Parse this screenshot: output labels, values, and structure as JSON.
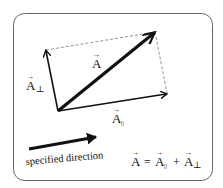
{
  "diagram": {
    "labels": {
      "vector_A": "A",
      "vector_A_perp": "A",
      "perp_subscript": "⊥",
      "vector_A_par": "A",
      "par_subscript": "||",
      "direction_caption": "specified direction",
      "equation_lhs": "A",
      "equation_eq": "=",
      "equation_t1": "A",
      "equation_t1_sub": "||",
      "equation_plus": "+",
      "equation_t2": "A",
      "equation_t2_sub": "⊥"
    },
    "colors": {
      "ink": "#111111",
      "frame": "#666666",
      "dashed": "#777777",
      "background": "#ffffff"
    }
  }
}
